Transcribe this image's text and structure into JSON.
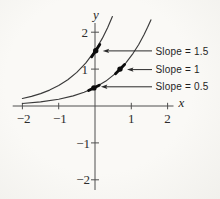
{
  "colors": {
    "background": "#f8f7f4",
    "axis": "#4f4f4f",
    "curve": "#3a3a3a",
    "marker": "#0c0c0c",
    "arrow": "#2a2a2a",
    "text": "#1e1e1e"
  },
  "chart_data": {
    "type": "line",
    "title": "",
    "xlabel": "x",
    "ylabel": "y",
    "xlim": [
      -2.4,
      2.3
    ],
    "ylim": [
      -2.5,
      2.6
    ],
    "grid": false,
    "legend": "none",
    "x_ticks": [
      -2,
      -1,
      1,
      2
    ],
    "x_tick_labels": [
      "−2",
      "−1",
      "1",
      "2"
    ],
    "y_ticks": [
      2,
      1,
      -1,
      -2
    ],
    "y_tick_labels": [
      "2",
      "1",
      "−1",
      "−2"
    ],
    "series": [
      {
        "name": "upper-exponential-curve",
        "points": [
          [
            -2,
            0.203
          ],
          [
            -1.75,
            0.261
          ],
          [
            -1.5,
            0.335
          ],
          [
            -1.25,
            0.43
          ],
          [
            -1,
            0.552
          ],
          [
            -0.75,
            0.709
          ],
          [
            -0.5,
            0.91
          ],
          [
            -0.25,
            1.168
          ],
          [
            0,
            1.5
          ],
          [
            0.2,
            1.832
          ],
          [
            0.35,
            2.129
          ],
          [
            0.48,
            2.423
          ]
        ]
      },
      {
        "name": "lower-exponential-curve",
        "points": [
          [
            -2,
            0.068
          ],
          [
            -1.5,
            0.112
          ],
          [
            -1,
            0.184
          ],
          [
            -0.6,
            0.274
          ],
          [
            -0.3,
            0.37
          ],
          [
            0,
            0.5
          ],
          [
            0.3,
            0.675
          ],
          [
            0.6,
            0.911
          ],
          [
            0.85,
            1.17
          ],
          [
            1.05,
            1.429
          ],
          [
            1.2,
            1.66
          ],
          [
            1.35,
            1.929
          ],
          [
            1.45,
            2.132
          ],
          [
            1.54,
            2.333
          ]
        ]
      }
    ],
    "tangent_points": [
      {
        "x": 0.02,
        "y": 1.5,
        "slope": 1.5,
        "label": "Slope = 1.5"
      },
      {
        "x": 0.69,
        "y": 1.0,
        "slope": 1.0,
        "label": "Slope = 1"
      },
      {
        "x": -0.03,
        "y": 0.49,
        "slope": 0.5,
        "label": "Slope = 0.5"
      }
    ]
  }
}
